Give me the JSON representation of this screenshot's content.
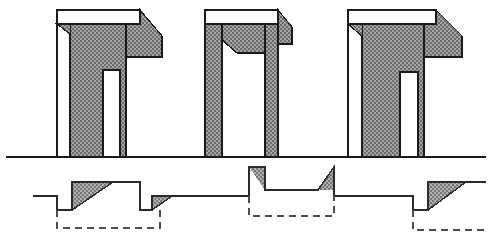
{
  "figure": {
    "width": 492,
    "height": 244,
    "background_color": "#ffffff",
    "line_color": "#1a1a1a",
    "fill_color": "#8c8c8c",
    "hatch_dark": "#6e6e6e",
    "hatch_light": "#a8a8a8",
    "dashed_color": "#4d4d4d"
  },
  "ground_line": {
    "name": "ground-line",
    "y": 157,
    "x_start": 6,
    "x_end": 486,
    "stroke_width": 1.6
  },
  "structures": [
    {
      "id": "structure-1",
      "label": "left structural bay",
      "outline_left_x": 57,
      "outline_right_x": 162,
      "top_y": 10,
      "base_y": 157,
      "beam_top_y": 10,
      "beam_bottom_y": 24,
      "cantilever_tip_x": 162,
      "cantilever_tip_y": 57,
      "main_column": {
        "x1": 70,
        "x2": 103,
        "top_y": 24,
        "base_y": 157
      },
      "inner_pier": {
        "x1": 103,
        "x2": 120,
        "top_y": 70,
        "base_y": 157
      },
      "void_gap": {
        "x1": 103,
        "x2": 120,
        "top_y": 70,
        "bottom_y": 157
      },
      "right_rib_x": 126
    },
    {
      "id": "structure-2",
      "label": "center portal frame",
      "outline_left_x": 205,
      "outline_right_x": 292,
      "top_y": 10,
      "base_y": 157,
      "beam_top_y": 10,
      "beam_bottom_y": 24,
      "cantilever_tip_x": 292,
      "cantilever_tip_y": 44,
      "left_leg": {
        "x1": 205,
        "x2": 222,
        "top_y": 24,
        "base_y": 157
      },
      "right_leg": {
        "x1": 265,
        "x2": 278,
        "top_y": 24,
        "base_y": 157
      },
      "soffit_notch": {
        "left_x": 222,
        "right_x": 265,
        "shoulder_y": 40,
        "throat_y": 53
      }
    },
    {
      "id": "structure-3",
      "label": "right structural bay",
      "outline_left_x": 348,
      "outline_right_x": 462,
      "top_y": 10,
      "base_y": 157,
      "beam_top_y": 10,
      "beam_bottom_y": 24,
      "cantilever_tip_x": 462,
      "cantilever_tip_y": 57,
      "main_column": {
        "x1": 362,
        "x2": 400,
        "top_y": 24,
        "base_y": 157
      },
      "inner_pier": {
        "x1": 400,
        "x2": 424,
        "top_y": 72,
        "base_y": 157
      },
      "void_gap": {
        "x1": 400,
        "x2": 424,
        "top_y": 72,
        "bottom_y": 157
      },
      "right_rib_x": 424
    }
  ],
  "profile": {
    "name": "foundation-profile",
    "baseline_y": 196,
    "upper_level_y": 182,
    "lower_level_y": 210,
    "segments": [
      {
        "id": "seg-start",
        "x1": 33,
        "x2": 57,
        "y": 196,
        "kind": "flat-base"
      },
      {
        "id": "seg-drop-1",
        "x": 57,
        "y1": 196,
        "y2": 210,
        "kind": "vertical-drop"
      },
      {
        "id": "seg-trench-1",
        "x1": 57,
        "x2": 72,
        "y": 210,
        "kind": "flat-trench"
      },
      {
        "id": "seg-ramp-1",
        "x1": 72,
        "x2": 113,
        "y1": 210,
        "y2": 182,
        "kind": "ramp-up-filled"
      },
      {
        "id": "seg-crest-1",
        "x1": 113,
        "x2": 140,
        "y": 182,
        "kind": "flat-crest"
      },
      {
        "id": "seg-drop-2",
        "x": 140,
        "y1": 182,
        "y2": 210,
        "kind": "vertical-drop"
      },
      {
        "id": "seg-trench-2",
        "x1": 140,
        "x2": 152,
        "y": 210,
        "kind": "flat-trench"
      },
      {
        "id": "seg-ramp-2",
        "x1": 152,
        "x2": 172,
        "y1": 210,
        "y2": 196,
        "kind": "ramp-up-filled"
      },
      {
        "id": "seg-flat-2",
        "x1": 172,
        "x2": 249,
        "y": 196,
        "kind": "flat-base"
      },
      {
        "id": "seg-rise-3",
        "x": 249,
        "y1": 196,
        "y2": 167,
        "kind": "vertical-rise"
      },
      {
        "id": "seg-crest-3",
        "x1": 249,
        "x2": 265,
        "y": 167,
        "kind": "flat-crest"
      },
      {
        "id": "seg-ramp-3",
        "x1": 249,
        "x2": 265,
        "y1": 167,
        "y2": 190,
        "kind": "ramp-down-filled"
      },
      {
        "id": "seg-plateau-3",
        "x1": 265,
        "x2": 318,
        "y": 190,
        "kind": "flat-plateau"
      },
      {
        "id": "seg-ramp-4",
        "x1": 318,
        "x2": 334,
        "y1": 190,
        "y2": 167,
        "kind": "ramp-up-filled"
      },
      {
        "id": "seg-crest-4",
        "x1": 318,
        "x2": 334,
        "y": 167,
        "kind": "flat-crest"
      },
      {
        "id": "seg-drop-4",
        "x": 334,
        "y1": 167,
        "y2": 196,
        "kind": "vertical-drop"
      },
      {
        "id": "seg-flat-4",
        "x1": 334,
        "x2": 413,
        "y": 196,
        "kind": "flat-base"
      },
      {
        "id": "seg-drop-5",
        "x": 413,
        "y1": 196,
        "y2": 210,
        "kind": "vertical-drop"
      },
      {
        "id": "seg-trench-5",
        "x1": 413,
        "x2": 428,
        "y": 210,
        "kind": "flat-trench"
      },
      {
        "id": "seg-ramp-5",
        "x1": 428,
        "x2": 466,
        "y1": 210,
        "y2": 182,
        "kind": "ramp-up-filled"
      },
      {
        "id": "seg-crest-5",
        "x1": 466,
        "x2": 492,
        "y": 182,
        "kind": "flat-crest"
      },
      {
        "id": "seg-drop-6",
        "x": 492,
        "y1": 182,
        "y2": 196,
        "kind": "vertical-drop"
      },
      {
        "id": "seg-end",
        "x1": 492,
        "x2": 520,
        "y": 196,
        "kind": "flat-base"
      }
    ]
  },
  "dashed_outlines": [
    {
      "id": "dashed-box-1",
      "label": "excavation envelope left",
      "x1": 57,
      "x2": 160,
      "top_y": 210,
      "bottom_y": 228,
      "dash": "7 5"
    },
    {
      "id": "dashed-box-2",
      "label": "excavation envelope center",
      "x1": 249,
      "x2": 334,
      "top_y": 196,
      "bottom_y": 216,
      "dash": "7 5"
    },
    {
      "id": "dashed-box-3",
      "label": "excavation envelope right",
      "x1": 413,
      "x2": 520,
      "top_y": 210,
      "bottom_y": 230,
      "dash": "7 5"
    }
  ]
}
